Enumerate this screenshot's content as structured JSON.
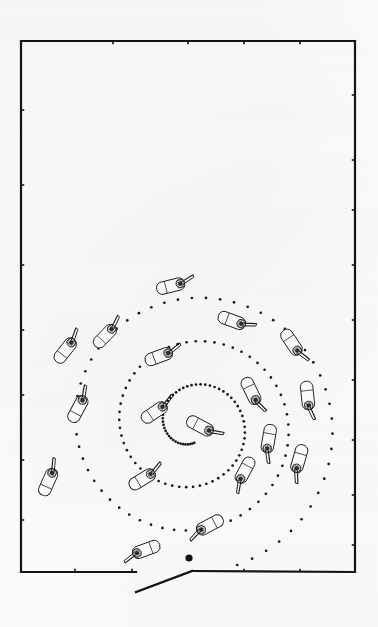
{
  "figure": {
    "type": "technical-line-drawing",
    "background_color": "#fdfdfc",
    "ink_color": "#141414",
    "canvas": {
      "width": 378,
      "height": 627
    }
  },
  "room": {
    "name": "rectangular-room-boundary",
    "stroke_color": "#141414",
    "stroke_width": 2.2,
    "x": 21,
    "y": 41,
    "width": 334,
    "height": 531,
    "walls": [
      {
        "name": "top-wall",
        "x1": 21,
        "y1": 41,
        "x2": 355,
        "y2": 41
      },
      {
        "name": "left-wall",
        "x1": 21,
        "y1": 41,
        "x2": 21,
        "y2": 572
      },
      {
        "name": "right-wall",
        "x1": 355,
        "y1": 41,
        "x2": 355,
        "y2": 572
      },
      {
        "name": "bottom-wall-left-segment",
        "x1": 21,
        "y1": 572,
        "x2": 136,
        "y2": 572
      },
      {
        "name": "bottom-wall-right-segment",
        "x1": 192,
        "y1": 571,
        "x2": 355,
        "y2": 572
      }
    ],
    "doorway": {
      "name": "door-opening-leaf",
      "x1": 136,
      "y1": 592,
      "x2": 192,
      "y2": 571,
      "gap_start_x": 136,
      "gap_end_x": 192
    },
    "wall_ticks": {
      "description": "small perpendicular tick marks along walls",
      "top": [
        113,
        188,
        244,
        300
      ],
      "bottom": [
        75,
        132,
        244,
        300
      ],
      "left": [
        110,
        185,
        265,
        330,
        395,
        460,
        520
      ],
      "right": [
        95,
        160,
        210,
        265,
        320,
        380,
        440,
        495,
        545
      ]
    }
  },
  "spiral": {
    "name": "dotted-spiral-path",
    "kind": "archimedean",
    "center_x": 193,
    "center_y": 425,
    "dot_color": "#1a1a1a",
    "dot_radius": 1.35,
    "dot_count": 176,
    "turns": 3.05,
    "start_radius": 18,
    "end_radius": 152,
    "start_angle_deg": 86,
    "aspect_ratio_y": 0.99,
    "start_marker": {
      "name": "spiral-start-marker",
      "x": 189,
      "y": 558,
      "radius": 3.6,
      "color": "#111111"
    }
  },
  "robots": {
    "name": "robot-icon-set",
    "count": 18,
    "body_color": "#ffffff",
    "outline_color": "#1c1c1c",
    "sensor_color": "#2a2a2a",
    "items": [
      {
        "id": "robot-01",
        "x": 175,
        "y": 285,
        "angle": -14,
        "scale": 1.0
      },
      {
        "id": "robot-02",
        "x": 236,
        "y": 322,
        "angle": 20,
        "scale": 1.0
      },
      {
        "id": "robot-03",
        "x": 294,
        "y": 346,
        "angle": 56,
        "scale": 1.0
      },
      {
        "id": "robot-04",
        "x": 68,
        "y": 347,
        "angle": -52,
        "scale": 1.0
      },
      {
        "id": "robot-05",
        "x": 163,
        "y": 355,
        "angle": -20,
        "scale": 1.0
      },
      {
        "id": "robot-06",
        "x": 253,
        "y": 395,
        "angle": 64,
        "scale": 1.0
      },
      {
        "id": "robot-07",
        "x": 80,
        "y": 405,
        "angle": -62,
        "scale": 1.0
      },
      {
        "id": "robot-08",
        "x": 158,
        "y": 410,
        "angle": -34,
        "scale": 1.0
      },
      {
        "id": "robot-09",
        "x": 204,
        "y": 428,
        "angle": 28,
        "scale": 1.0
      },
      {
        "id": "robot-10",
        "x": 268,
        "y": 443,
        "angle": 100,
        "scale": 1.0
      },
      {
        "id": "robot-11",
        "x": 298,
        "y": 463,
        "angle": 106,
        "scale": 1.0
      },
      {
        "id": "robot-12",
        "x": 50,
        "y": 478,
        "angle": -66,
        "scale": 1.0
      },
      {
        "id": "robot-13",
        "x": 146,
        "y": 477,
        "angle": -32,
        "scale": 1.0
      },
      {
        "id": "robot-14",
        "x": 206,
        "y": 527,
        "angle": 152,
        "scale": 1.0
      },
      {
        "id": "robot-15",
        "x": 142,
        "y": 551,
        "angle": 160,
        "scale": 1.0
      },
      {
        "id": "robot-16",
        "x": 308,
        "y": 400,
        "angle": 84,
        "scale": 1.0
      },
      {
        "id": "robot-17",
        "x": 108,
        "y": 333,
        "angle": -46,
        "scale": 0.98
      },
      {
        "id": "robot-18",
        "x": 243,
        "y": 474,
        "angle": 118,
        "scale": 0.98
      }
    ]
  }
}
